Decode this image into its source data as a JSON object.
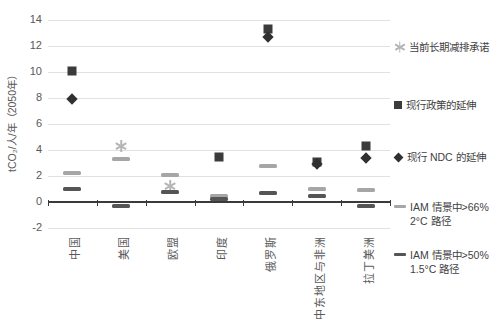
{
  "chart_data": {
    "type": "scatter",
    "title": "",
    "ylabel": "tCO₂/人/年（2050年）",
    "xlabel": "",
    "ylim": [
      -2,
      14
    ],
    "yticks": [
      14,
      12,
      10,
      8,
      6,
      4,
      2,
      0,
      -2
    ],
    "grid": true,
    "legend_position": "right",
    "categories": [
      "中国",
      "美国",
      "欧盟",
      "印度",
      "俄罗斯",
      "中东地区与非洲",
      "拉丁美洲"
    ],
    "series": [
      {
        "name": "当前长期减排承诺",
        "marker": "asterisk",
        "color": "#b5b5b5",
        "values": [
          null,
          4.3,
          1.2,
          null,
          null,
          null,
          null
        ]
      },
      {
        "name": "现行政策的延伸",
        "marker": "square",
        "color": "#3b3b3b",
        "values": [
          10.1,
          null,
          null,
          3.5,
          13.3,
          3.1,
          4.3
        ]
      },
      {
        "name": "现行 NDC 的延伸",
        "marker": "diamond",
        "color": "#303030",
        "values": [
          7.9,
          null,
          null,
          null,
          12.7,
          2.9,
          3.4
        ]
      },
      {
        "name": "IAM 情景中>66% 2°C 路径",
        "legend_lines": [
          "IAM 情景中>66%",
          "2°C 路径"
        ],
        "marker": "dash",
        "color": "#a6a6a6",
        "values": [
          2.2,
          3.3,
          2.1,
          0.5,
          2.8,
          1.0,
          0.9
        ]
      },
      {
        "name": "IAM 情景中>50% 1.5°C 路径",
        "legend_lines": [
          "IAM 情景中>50%",
          "1.5°C 路径"
        ],
        "marker": "dash",
        "color": "#555555",
        "values": [
          1.0,
          -0.3,
          0.8,
          0.2,
          0.7,
          0.5,
          -0.3
        ]
      }
    ]
  }
}
